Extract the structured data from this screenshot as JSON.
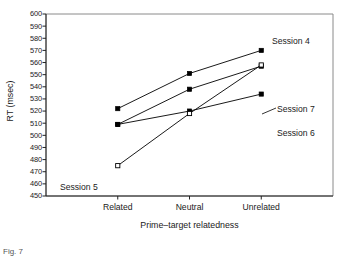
{
  "chart_data": {
    "type": "line",
    "title": "",
    "xlabel": "Prime–target relatedness",
    "ylabel": "RT (msec)",
    "categories": [
      "Related",
      "Neutral",
      "Unrelated"
    ],
    "ylim": [
      450,
      600
    ],
    "ytick_step": 10,
    "yticks": [
      450,
      460,
      470,
      480,
      490,
      500,
      510,
      520,
      530,
      540,
      550,
      560,
      570,
      580,
      590,
      600
    ],
    "grid": false,
    "legend_position": "inline-right-of-endpoints",
    "series": [
      {
        "name": "Session 4",
        "values": [
          522,
          551,
          570
        ],
        "marker": "filled-square",
        "color": "#000000"
      },
      {
        "name": "Session 7",
        "values": [
          509,
          538,
          557
        ],
        "marker": "filled-square",
        "color": "#000000"
      },
      {
        "name": "Session 6",
        "values": [
          509,
          520,
          534
        ],
        "marker": "filled-square",
        "color": "#000000"
      },
      {
        "name": "Session 5",
        "values": [
          475,
          518,
          558
        ],
        "marker": "open-square",
        "color": "#000000"
      }
    ],
    "annotations": [
      {
        "text": "Session 4",
        "x": "Unrelated",
        "y": 578
      },
      {
        "text": "Session 7",
        "x": "Unrelated",
        "y": 545
      },
      {
        "text": "Session 6",
        "x": "Unrelated",
        "y": 524
      },
      {
        "text": "Session 5",
        "x": "Related",
        "y": 468
      }
    ]
  },
  "figure": {
    "caption_fragment": "Fig. 7"
  }
}
